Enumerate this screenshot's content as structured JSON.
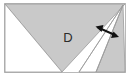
{
  "figure": {
    "name": "triangle-partition-diagram",
    "canvas": {
      "width": 132,
      "height": 80
    },
    "background_color": "#ffffff",
    "frame": {
      "name": "figure-border",
      "color": "#b9b9b9",
      "fill": "#ffffff",
      "stroke_width": 1,
      "x": 4,
      "y": 3,
      "width": 122,
      "height": 70
    },
    "labels": [
      {
        "id": "region-label-d",
        "text": "D",
        "x": 68,
        "y": 39,
        "color": "#2b2b2b",
        "font_size": 13
      }
    ],
    "regions": [
      {
        "id": "shaded-triangle-main",
        "role": "large-shaded-triangle",
        "fill": "#c9c9c9",
        "stroke": "#9a9a9a",
        "points": "5,4 125,4 62,72"
      },
      {
        "id": "white-triangle-left",
        "role": "white-triangle-lower-left",
        "fill": "#ffffff",
        "stroke": "#9a9a9a",
        "points": "5,4 62,72 5,72"
      },
      {
        "id": "white-wedge-right",
        "role": "white-narrow-wedge",
        "fill": "#ffffff",
        "stroke": "#9a9a9a",
        "points": "123,5 96,72 79,72"
      },
      {
        "id": "shaded-triangle-right",
        "role": "shaded-sliver-right",
        "fill": "#c9c9c9",
        "stroke": "#9a9a9a",
        "points": "123,5 125,72 96,72"
      }
    ],
    "annotations": [
      {
        "id": "width-measure-arrow",
        "role": "double-headed-arrow",
        "color": "#111111",
        "stroke_width": 2,
        "x1": 97,
        "y1": 27,
        "x2": 117,
        "y2": 36,
        "head_size": 6,
        "double_headed": true
      }
    ]
  }
}
